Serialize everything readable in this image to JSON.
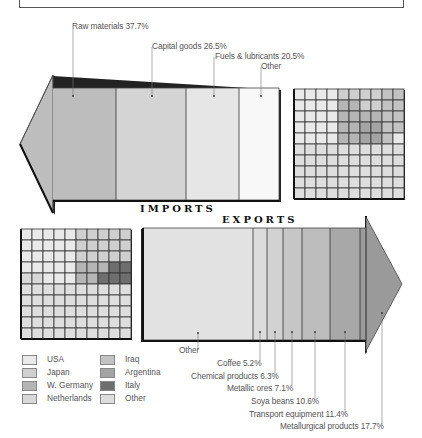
{
  "header": {
    "title_clipped": ""
  },
  "imports": {
    "title": "IMPORTS",
    "segments": [
      {
        "label": "Raw materials 37.7%",
        "name": "Raw materials",
        "value": 37.7,
        "color": "#bdbdbd"
      },
      {
        "label": "Capital goods 26.5%",
        "name": "Capital goods",
        "value": 26.5,
        "color": "#d4d4d4"
      },
      {
        "label": "Fuels & lubricants 20.5%",
        "name": "Fuels & lubricants",
        "value": 20.5,
        "color": "#e6e6e6"
      },
      {
        "label": "Other",
        "name": "Other",
        "value": 15.3,
        "color": "#f8f8f8"
      }
    ]
  },
  "exports": {
    "title": "EXPORTS",
    "segments": [
      {
        "label": "Other",
        "name": "Other",
        "value": 41.7,
        "color": "#e2e2e2"
      },
      {
        "label": "Coffee 5.2%",
        "name": "Coffee",
        "value": 5.2,
        "color": "#dcdcdc"
      },
      {
        "label": "Chemical products 6.3%",
        "name": "Chemical products",
        "value": 6.3,
        "color": "#d2d2d2"
      },
      {
        "label": "Metallic ores 7.1%",
        "name": "Metallic ores",
        "value": 7.1,
        "color": "#c6c6c6"
      },
      {
        "label": "Soya beans 10.6%",
        "name": "Soya beans",
        "value": 10.6,
        "color": "#bdbdbd"
      },
      {
        "label": "Transport equipment 11.4%",
        "name": "Transport equipment",
        "value": 11.4,
        "color": "#a8a8a8"
      },
      {
        "label": "Metallurgical products 17.7%",
        "name": "Metallurgical products",
        "value": 17.7,
        "color": "#9a9a9a"
      }
    ]
  },
  "legend": {
    "items": [
      {
        "label": "USA",
        "color": "#e9e9e9"
      },
      {
        "label": "Japan",
        "color": "#cfcfcf"
      },
      {
        "label": "W. Germany",
        "color": "#b5b5b5"
      },
      {
        "label": "Netherlands",
        "color": "#d8d8d8"
      },
      {
        "label": "Iraq",
        "color": "#c2c2c2"
      },
      {
        "label": "Argentina",
        "color": "#a4a4a4"
      },
      {
        "label": "Italy",
        "color": "#6e6e6e"
      },
      {
        "label": "Other",
        "color": "#dedede"
      }
    ]
  },
  "grids": {
    "imports_grid": [
      [
        "USA",
        "USA",
        "USA",
        "USA",
        "Japan",
        "Japan",
        "Japan",
        "Japan",
        "Iraq",
        "Iraq"
      ],
      [
        "USA",
        "USA",
        "USA",
        "USA",
        "W. Germany",
        "W. Germany",
        "Japan",
        "Japan",
        "Iraq",
        "Iraq"
      ],
      [
        "USA",
        "USA",
        "USA",
        "USA",
        "W. Germany",
        "W. Germany",
        "W. Germany",
        "W. Germany",
        "Iraq",
        "Iraq"
      ],
      [
        "USA",
        "USA",
        "USA",
        "USA",
        "W. Germany",
        "W. Germany",
        "Argentina",
        "Argentina",
        "Iraq",
        "Iraq"
      ],
      [
        "USA",
        "USA",
        "USA",
        "USA",
        "W. Germany",
        "W. Germany",
        "Argentina",
        "Argentina",
        "Iraq",
        "USA"
      ],
      [
        "Other",
        "Other",
        "Other",
        "Other",
        "Other",
        "Other",
        "Other",
        "Other",
        "Other",
        "Other"
      ],
      [
        "Other",
        "Other",
        "Other",
        "Other",
        "Other",
        "Other",
        "Other",
        "Other",
        "Other",
        "Other"
      ],
      [
        "Other",
        "Other",
        "Other",
        "Other",
        "Other",
        "Other",
        "Other",
        "Other",
        "Other",
        "Other"
      ],
      [
        "Other",
        "Other",
        "Other",
        "Other",
        "Other",
        "Other",
        "Other",
        "Other",
        "Other",
        "Other"
      ],
      [
        "Other",
        "Other",
        "Other",
        "Other",
        "Other",
        "Other",
        "Other",
        "Other",
        "Other",
        "Other"
      ]
    ],
    "exports_grid": [
      [
        "USA",
        "USA",
        "USA",
        "USA",
        "USA",
        "Japan",
        "Japan",
        "Japan",
        "Japan",
        "Japan"
      ],
      [
        "USA",
        "USA",
        "USA",
        "USA",
        "USA",
        "Japan",
        "Japan",
        "Japan",
        "Japan",
        "Japan"
      ],
      [
        "USA",
        "USA",
        "USA",
        "USA",
        "USA",
        "Japan",
        "Japan",
        "Japan",
        "Japan",
        "Japan"
      ],
      [
        "USA",
        "USA",
        "USA",
        "USA",
        "USA",
        "W. Germany",
        "W. Germany",
        "W. Germany",
        "Italy",
        "Italy"
      ],
      [
        "Netherlands",
        "Netherlands",
        "USA",
        "USA",
        "USA",
        "W. Germany",
        "W. Germany",
        "Italy",
        "Italy",
        "Italy"
      ],
      [
        "Other",
        "Other",
        "Other",
        "Other",
        "Other",
        "Other",
        "Other",
        "Other",
        "Other",
        "Other"
      ],
      [
        "Other",
        "Other",
        "Other",
        "Other",
        "Other",
        "Other",
        "Other",
        "Other",
        "Other",
        "Other"
      ],
      [
        "Other",
        "Other",
        "Other",
        "Other",
        "Other",
        "Other",
        "Other",
        "Other",
        "Other",
        "Other"
      ],
      [
        "Other",
        "Other",
        "Other",
        "Other",
        "Other",
        "Other",
        "Other",
        "Other",
        "Other",
        "Other"
      ],
      [
        "Other",
        "Other",
        "Other",
        "Other",
        "Other",
        "Other",
        "Other",
        "Other",
        "Other",
        "Other"
      ]
    ]
  }
}
